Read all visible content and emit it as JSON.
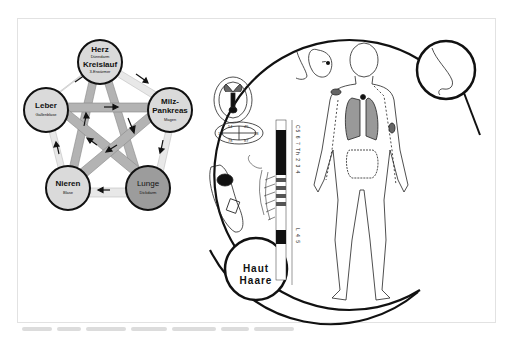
{
  "five_elements": {
    "nodes": [
      {
        "id": "herz",
        "title": "Herz",
        "subtitle": "Dünndarm",
        "title2": "Kreislauf",
        "subtitle2": "3-Erwärmer",
        "fill": "#d9d9d9"
      },
      {
        "id": "milz",
        "title": "Milz-",
        "title_b": "Pankreas",
        "subtitle": "Magen",
        "fill": "#d9d9d9"
      },
      {
        "id": "lunge",
        "title": "Lunge",
        "subtitle": "Dickdarm",
        "fill": "#9a9a9a"
      },
      {
        "id": "nieren",
        "title": "Nieren",
        "subtitle": "Blase",
        "fill": "#d9d9d9"
      },
      {
        "id": "leber",
        "title": "Leber",
        "subtitle": "Gallenblase",
        "fill": "#d9d9d9"
      }
    ],
    "colors": {
      "outer_band": "#e6e6e6",
      "inner_band": "#b0b0b0",
      "stroke": "#111111"
    }
  },
  "body_map": {
    "skin_circle": {
      "line1": "Haut",
      "line2": "Haare"
    },
    "spine_labels": {
      "upper": "C5 6 7 Th 2 3 4",
      "lower": "L 4 5"
    },
    "teeth_labels": [
      "54",
      "45",
      "18",
      "28",
      "78",
      "87"
    ],
    "magnifier_subject": "nose"
  },
  "caption": {
    "visible": true
  }
}
